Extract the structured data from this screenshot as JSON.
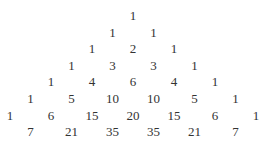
{
  "rows": [
    [
      "1"
    ],
    [
      "1",
      "1"
    ],
    [
      "1",
      "2",
      "1"
    ],
    [
      "1",
      "3",
      "3",
      "1"
    ],
    [
      "1",
      "4",
      "6",
      "4",
      "1"
    ],
    [
      "1",
      "5",
      "10",
      "10",
      "5",
      "1"
    ],
    [
      "1",
      "6",
      "15",
      "20",
      "15",
      "6",
      "1"
    ],
    [
      "1",
      "7",
      "21",
      "35",
      "35",
      "21",
      "7",
      "1"
    ]
  ]
}
